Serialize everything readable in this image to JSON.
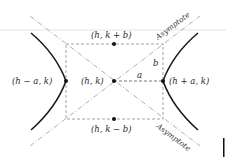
{
  "diagram": {
    "labels": {
      "top_point": "(h, k + b)",
      "bottom_point": "(h, k − b)",
      "center": "(h, k)",
      "left_vertex": "(h − a, k)",
      "right_vertex": "(h + a, k)",
      "semi_axis_a": "a",
      "semi_axis_b": "b",
      "asymptote_upper": "Asymptote",
      "asymptote_lower": "Asymptote"
    },
    "colors": {
      "curve": "#1a1a1a",
      "dashed": "#8a8a8a",
      "asymptote": "#9a9a9a",
      "point": "#111111",
      "rule": "#e3e3e3"
    }
  }
}
